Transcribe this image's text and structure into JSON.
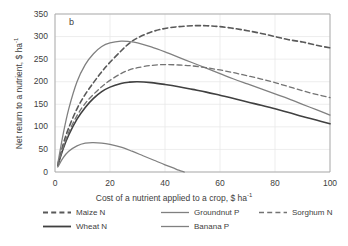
{
  "panel_label": "b",
  "colors": {
    "axis": "#a6a6a6",
    "grid": "#e8e8e8",
    "text": "#404040",
    "maize": "#595959",
    "wheat": "#404040",
    "groundnut": "#808080",
    "banana": "#808080",
    "sorghum": "#737373"
  },
  "chart_data": {
    "type": "line",
    "title": "",
    "xlabel": "Cost of a nutrient applied to a crop, $ ha-1",
    "ylabel": "Net return to a nutrient, $ ha-1",
    "xlim": [
      0,
      100
    ],
    "ylim": [
      0,
      350
    ],
    "xticks": [
      0,
      20,
      40,
      60,
      80,
      100
    ],
    "yticks": [
      0,
      50,
      100,
      150,
      200,
      250,
      300,
      350
    ],
    "grid": true,
    "legend_position": "bottom",
    "series": [
      {
        "name": "Maize N",
        "style": "dashed",
        "color": "#595959",
        "width": 1.6,
        "x": [
          1,
          3,
          5,
          8,
          11,
          14,
          17,
          20,
          24,
          27,
          30,
          35,
          40,
          45,
          50,
          55,
          60,
          65,
          70,
          75,
          80,
          85,
          90,
          95,
          100
        ],
        "y": [
          16,
          62,
          98,
          140,
          172,
          198,
          222,
          243,
          268,
          285,
          297,
          310,
          318,
          322,
          324,
          324,
          322,
          318,
          313,
          307,
          300,
          293,
          288,
          281,
          275
        ]
      },
      {
        "name": "Wheat N",
        "style": "solid",
        "color": "#404040",
        "width": 1.6,
        "x": [
          1,
          3,
          5,
          8,
          11,
          14,
          17,
          20,
          24,
          27,
          30,
          35,
          40,
          45,
          50,
          55,
          60,
          65,
          70,
          75,
          80,
          85,
          90,
          95,
          100
        ],
        "y": [
          14,
          52,
          82,
          117,
          143,
          163,
          178,
          188,
          196,
          199,
          200,
          198,
          194,
          189,
          183,
          177,
          170,
          163,
          155,
          148,
          140,
          132,
          123,
          115,
          107
        ]
      },
      {
        "name": "Groundnut P",
        "style": "solid",
        "color": "#808080",
        "width": 1.3,
        "x": [
          1,
          3,
          5,
          8,
          11,
          14,
          17,
          20,
          24,
          27,
          30,
          35,
          40,
          45,
          50,
          55,
          60,
          65,
          70,
          75,
          80,
          85,
          90,
          95,
          100
        ],
        "y": [
          18,
          85,
          140,
          200,
          238,
          262,
          278,
          286,
          290,
          289,
          286,
          277,
          266,
          254,
          242,
          230,
          218,
          206,
          195,
          184,
          173,
          162,
          150,
          138,
          126
        ]
      },
      {
        "name": "Banana P",
        "style": "solid",
        "color": "#808080",
        "width": 1.3,
        "x": [
          1,
          3,
          5,
          8,
          11,
          14,
          17,
          20,
          24,
          28,
          32,
          36,
          40,
          43,
          45,
          47
        ],
        "y": [
          11,
          32,
          46,
          58,
          64,
          65,
          64,
          61,
          55,
          46,
          36,
          26,
          16,
          9,
          4,
          0
        ]
      },
      {
        "name": "Sorghum N",
        "style": "dashed",
        "color": "#737373",
        "width": 1.3,
        "x": [
          1,
          3,
          5,
          8,
          11,
          14,
          17,
          20,
          24,
          27,
          30,
          35,
          40,
          45,
          50,
          55,
          60,
          65,
          70,
          75,
          80,
          85,
          90,
          95,
          100
        ],
        "y": [
          15,
          55,
          88,
          125,
          152,
          172,
          189,
          203,
          218,
          226,
          231,
          236,
          238,
          237,
          235,
          231,
          226,
          220,
          213,
          206,
          198,
          189,
          180,
          172,
          165
        ]
      }
    ]
  },
  "legend": [
    {
      "label": "Maize N",
      "style": "dashed",
      "color": "#595959",
      "width": 1.8
    },
    {
      "label": "Wheat N",
      "style": "solid",
      "color": "#404040",
      "width": 1.8
    },
    {
      "label": "Groundnut P",
      "style": "solid",
      "color": "#808080",
      "width": 1.3
    },
    {
      "label": "Banana P",
      "style": "solid",
      "color": "#808080",
      "width": 1.3
    },
    {
      "label": "Sorghum N",
      "style": "dashed",
      "color": "#737373",
      "width": 1.3
    }
  ]
}
